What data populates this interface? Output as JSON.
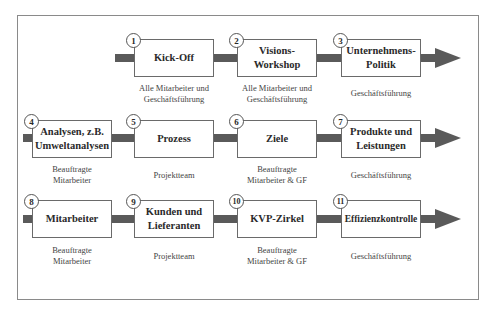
{
  "diagram": {
    "type": "process-flow",
    "rows": [
      {
        "steps": [
          {
            "number": "1",
            "title": "Kick-Off",
            "responsible": "Alle Mitarbeiter und\nGeschäftsführung"
          },
          {
            "number": "2",
            "title": "Visions-\nWorkshop",
            "responsible": "Alle Mitarbeiter und\nGeschäftsführung"
          },
          {
            "number": "3",
            "title": "Unternehmens-\nPolitik",
            "responsible": "Geschäftsführung"
          }
        ]
      },
      {
        "steps": [
          {
            "number": "4",
            "title": "Analysen, z.B.\nUmweltanalysen",
            "responsible": "Beauftragte\nMitarbeiter"
          },
          {
            "number": "5",
            "title": "Prozess",
            "responsible": "Projektteam"
          },
          {
            "number": "6",
            "title": "Ziele",
            "responsible": "Beauftragte\nMitarbeiter & GF"
          },
          {
            "number": "7",
            "title": "Produkte und\nLeistungen",
            "responsible": "Geschäftsführung"
          }
        ]
      },
      {
        "steps": [
          {
            "number": "8",
            "title": "Mitarbeiter",
            "responsible": "Beauftragte\nMitarbeiter"
          },
          {
            "number": "9",
            "title": "Kunden und\nLieferanten",
            "responsible": "Projektteam"
          },
          {
            "number": "10",
            "title": "KVP-Zirkel",
            "responsible": "Beauftragte\nMitarbeiter & GF"
          },
          {
            "number": "11",
            "title": "Effizienzkontrolle",
            "responsible": "Geschäftsführung"
          }
        ]
      }
    ],
    "colors": {
      "arrow": "#5a5a5a",
      "box_border": "#6a6a6a",
      "frame": "#8a8a8a"
    }
  }
}
